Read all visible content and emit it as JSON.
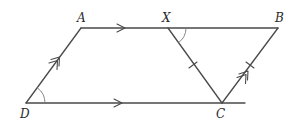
{
  "diagram": {
    "type": "geometry",
    "stroke_color": "#4a4a4a",
    "points": {
      "A": {
        "label": "A",
        "x": 81,
        "y": 28
      },
      "X": {
        "label": "X",
        "x": 168,
        "y": 28
      },
      "B": {
        "label": "B",
        "x": 278,
        "y": 28
      },
      "C": {
        "label": "C",
        "x": 222,
        "y": 103
      },
      "D": {
        "label": "D",
        "x": 26,
        "y": 103
      }
    },
    "segments": [
      {
        "from": "A",
        "to": "B",
        "note": "top line, single arrow (parallel to DC)"
      },
      {
        "from": "D",
        "to": "C",
        "note": "bottom line, single arrow, extends past C"
      },
      {
        "from": "D",
        "to": "A",
        "note": "double arrow (parallel to CB)"
      },
      {
        "from": "C",
        "to": "B",
        "note": "double arrow, single tick (equal to XC)"
      },
      {
        "from": "X",
        "to": "C",
        "note": "single tick (equal to CB)"
      }
    ],
    "angle_marks": [
      {
        "vertex": "D",
        "between": [
          "A",
          "C"
        ]
      },
      {
        "vertex": "X",
        "between": [
          "B",
          "C"
        ]
      }
    ]
  }
}
